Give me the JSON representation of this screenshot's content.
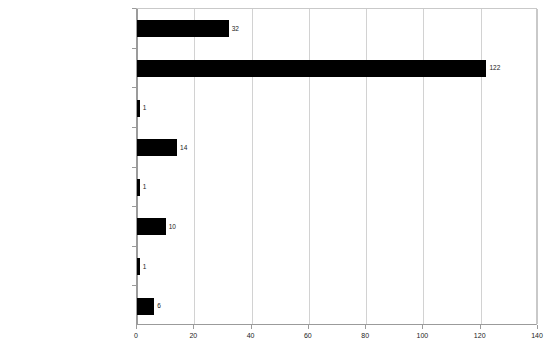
{
  "chart_data": {
    "type": "bar",
    "orientation": "horizontal",
    "title": "",
    "xlabel": "",
    "ylabel": "",
    "xlim": [
      0,
      140
    ],
    "xticks": [
      "0",
      "20",
      "40",
      "60",
      "80",
      "100",
      "120",
      "140"
    ],
    "grid": "vertical",
    "legend": "none",
    "bar_color": "#000000",
    "categories": [
      "Delft",
      "Redware",
      "Earthenware, burned",
      "Gray salt-glazed stoneware",
      "Gray salt-glazed stoneware w scratch blue",
      "White salt-glazed stoneware",
      "White salt-glazed stoneware w scratch blue",
      "Porcelain"
    ],
    "values": [
      32,
      122,
      1,
      14,
      1,
      10,
      1,
      6
    ],
    "value_labels": [
      "32",
      "122",
      "1",
      "14",
      "1",
      "10",
      "1",
      "6"
    ]
  }
}
